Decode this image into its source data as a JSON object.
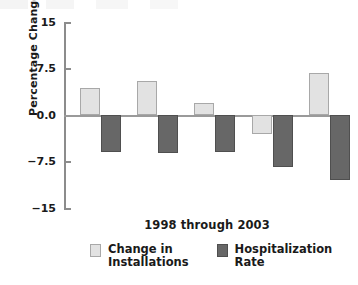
{
  "chart_data": {
    "type": "bar",
    "title": "",
    "xlabel": "1998 through 2003",
    "ylabel": "Percentage Change",
    "categories": [
      "1998",
      "1999",
      "2000",
      "2001",
      "2002"
    ],
    "ylim": [
      -15,
      15
    ],
    "yticks": [
      15,
      7.5,
      0.0,
      -7.5,
      -15
    ],
    "ytick_labels": [
      "15",
      "7.5",
      "0.0",
      "−7.5",
      "−15"
    ],
    "grid": false,
    "legend_position": "bottom",
    "series": [
      {
        "name": "Change in\nInstallations",
        "color": "#e2e2e2",
        "values": [
          4.3,
          5.5,
          2.0,
          -3.1,
          6.8
        ]
      },
      {
        "name": "Hospitalization Rate",
        "color": "#676767",
        "values": [
          -6.0,
          -6.1,
          -6.0,
          -8.4,
          -10.5
        ]
      }
    ]
  },
  "axes": {
    "y_title": "Percentage Change",
    "x_caption": "1998 through 2003"
  },
  "legend": {
    "items": [
      {
        "label": "Change in\nInstallations",
        "swatch": "light"
      },
      {
        "label": "Hospitalization Rate",
        "swatch": "dark"
      }
    ]
  }
}
